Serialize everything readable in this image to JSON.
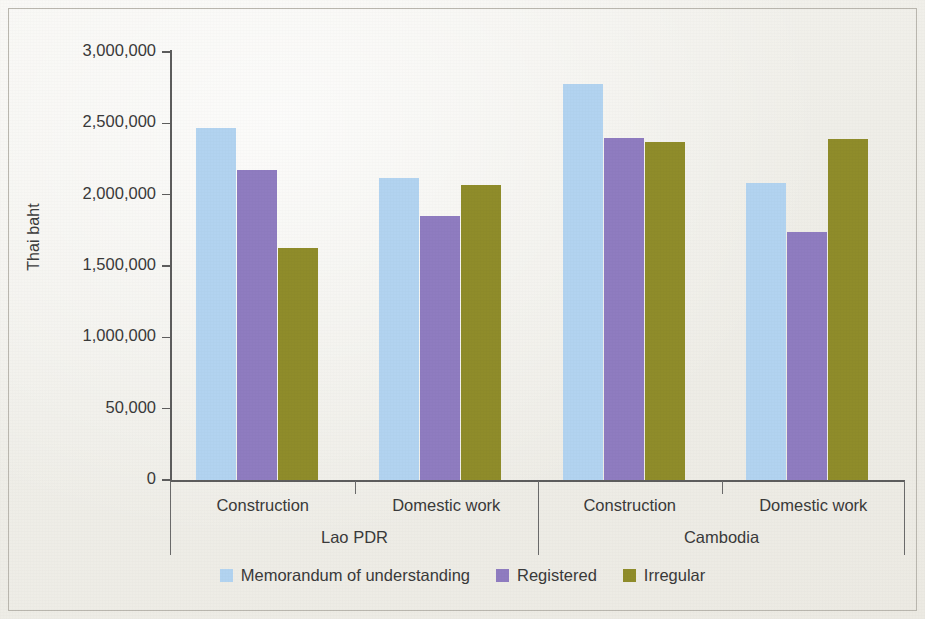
{
  "chart_data": {
    "type": "bar",
    "title": "",
    "xlabel": "",
    "ylabel": "Thai baht",
    "ylim": [
      0,
      3000000
    ],
    "grid": false,
    "legend_position": "bottom",
    "y_ticks": [
      {
        "value": 0,
        "label": "0"
      },
      {
        "value": 500000,
        "label": "50,000"
      },
      {
        "value": 1000000,
        "label": "1,000,000"
      },
      {
        "value": 1500000,
        "label": "1,500,000"
      },
      {
        "value": 2000000,
        "label": "2,000,000"
      },
      {
        "value": 2500000,
        "label": "2,500,000"
      },
      {
        "value": 3000000,
        "label": "3,000,000"
      }
    ],
    "groups": [
      {
        "label": "Lao PDR",
        "categories": [
          "Construction",
          "Domestic work"
        ]
      },
      {
        "label": "Cambodia",
        "categories": [
          "Construction",
          "Domestic work"
        ]
      }
    ],
    "categories": [
      "Lao PDR / Construction",
      "Lao PDR / Domestic work",
      "Cambodia / Construction",
      "Cambodia / Domestic work"
    ],
    "series": [
      {
        "name": "Memorandum of understanding",
        "color": "#b2d3f0",
        "values": [
          2470000,
          2120000,
          2775000,
          2080000
        ]
      },
      {
        "name": "Registered",
        "color": "#8f7cc0",
        "values": [
          2175000,
          1850000,
          2395000,
          1740000
        ]
      },
      {
        "name": "Irregular",
        "color": "#8f8c2a",
        "values": [
          1625000,
          2065000,
          2370000,
          2390000
        ]
      }
    ]
  },
  "colors": {
    "mou": "#b2d3f0",
    "registered": "#8f7cc0",
    "irregular": "#8f8c2a",
    "axis": "#5d5d5d",
    "text": "#3a3a3a",
    "paper": "#f1f0ea"
  }
}
